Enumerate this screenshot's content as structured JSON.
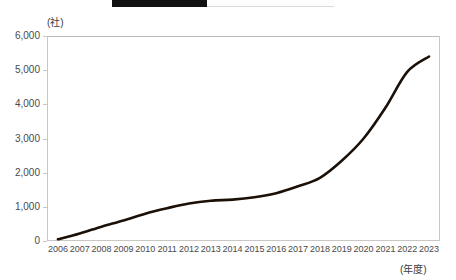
{
  "header": {
    "band_label": "",
    "band_color": "#111111",
    "band_background": "#fdfdfd"
  },
  "chart_data": {
    "type": "line",
    "title": "",
    "xlabel": "(年度)",
    "ylabel": "(社)",
    "x": [
      2006,
      2007,
      2008,
      2009,
      2010,
      2011,
      2012,
      2013,
      2014,
      2015,
      2016,
      2017,
      2018,
      2019,
      2020,
      2021,
      2022,
      2023
    ],
    "categories": [
      "2006",
      "2007",
      "2008",
      "2009",
      "2010",
      "2011",
      "2012",
      "2013",
      "2014",
      "2015",
      "2016",
      "2017",
      "2018",
      "2019",
      "2020",
      "2021",
      "2022",
      "2023"
    ],
    "values": [
      50,
      220,
      420,
      600,
      800,
      960,
      1100,
      1180,
      1210,
      1280,
      1400,
      1600,
      1850,
      2350,
      3000,
      3900,
      4950,
      5400
    ],
    "series": [
      {
        "name": "社数",
        "color": "#1a1008",
        "values": [
          50,
          220,
          420,
          600,
          800,
          960,
          1100,
          1180,
          1210,
          1280,
          1400,
          1600,
          1850,
          2350,
          3000,
          3900,
          4950,
          5400
        ]
      }
    ],
    "ylim": [
      0,
      6000
    ],
    "ytick_values": [
      6000,
      5000,
      4000,
      3000,
      2000,
      1000,
      0
    ],
    "ytick_labels": [
      "6,000",
      "5,000",
      "4,000",
      "3,000",
      "2,000",
      "1,000",
      "0"
    ],
    "grid": false,
    "legend": "none",
    "line_color": "#1a1008",
    "axis_color": "#c9c7c4"
  }
}
